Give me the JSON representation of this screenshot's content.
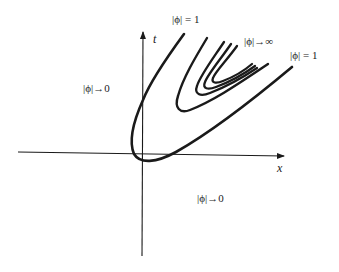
{
  "diagram": {
    "axes": {
      "x_label": "x",
      "y_label": "t"
    },
    "region_labels": {
      "left": "|ϕ|→0",
      "bottom": "|ϕ|→0",
      "top_curve": "|ϕ| = 1",
      "right_curve": "|ϕ| = 1",
      "center": "|ϕ|→∞"
    },
    "stroke_color": "#1a1a1a",
    "background": "#ffffff"
  }
}
